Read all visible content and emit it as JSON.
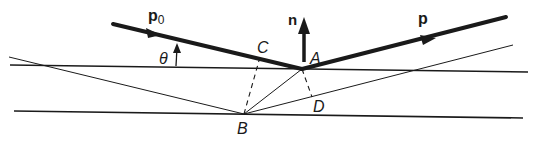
{
  "diagram": {
    "type": "geometric-optics / Bragg reflection construction",
    "labels": {
      "incident_vector": "p",
      "incident_sub": "0",
      "normal": "n",
      "reflected_vector": "p",
      "angle": "θ",
      "point_A": "A",
      "point_B": "B",
      "point_C": "C",
      "point_D": "D"
    },
    "colors": {
      "ink": "#1a1a1a",
      "background": "#ffffff"
    },
    "elements": [
      "upper surface line",
      "lower surface line",
      "incident ray p0 (thick, arrow) hitting A",
      "reflected ray p (thick, arrow) leaving A",
      "normal vector n at A (thick arrow up)",
      "thin incident ray to B",
      "thin reflected ray from B",
      "thin line B to A",
      "dashed perpendicular B to C",
      "dashed perpendicular A to D",
      "angle θ arc arrow"
    ]
  }
}
